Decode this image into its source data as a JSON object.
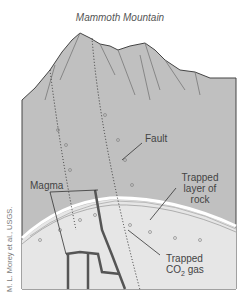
{
  "title": "Mammoth Mountain",
  "labels": {
    "fault": "Fault",
    "magma": "Magma",
    "trapped_rock_line1": "Trapped",
    "trapped_rock_line2": "layer of",
    "trapped_rock_line3": "rock",
    "trapped_gas_line1": "Trapped",
    "trapped_gas_co": "CO",
    "trapped_gas_sub": "2",
    "trapped_gas_rest": " gas"
  },
  "credit": "M. L. Morey et al., USGS.",
  "colors": {
    "mountain_fill": "#bdbdbd",
    "ground_fill": "#c4c4c4",
    "gas_zone_fill": "#e4e4e4",
    "outline": "#444444",
    "magma": "#555555"
  }
}
